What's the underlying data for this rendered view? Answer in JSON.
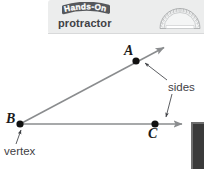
{
  "page": {
    "width": 204,
    "height": 169,
    "background": "#ffffff"
  },
  "header": {
    "banner_background": "#eceded",
    "logo_text": "Hands-On",
    "logo_icon": "hands-on-bubble-logo",
    "title": "protractor",
    "graphic_icon": "protractor-semicircle-icon",
    "text_color": "#3f4145"
  },
  "diagram": {
    "type": "angle-with-labeled-vertex-and-sides",
    "line_color": "#8a8c8e",
    "point_color": "#111111",
    "points": [
      {
        "name": "A",
        "label": "A",
        "x": 136,
        "y": 61
      },
      {
        "name": "B",
        "label": "B",
        "x": 20,
        "y": 124
      },
      {
        "name": "C",
        "label": "C",
        "x": 155,
        "y": 124
      }
    ],
    "rays": [
      {
        "name": "ray-BA",
        "from": "B",
        "through": "A",
        "arrow_tip_x": 166,
        "arrow_tip_y": 46
      },
      {
        "name": "ray-BC",
        "from": "B",
        "through": "C",
        "arrow_tip_x": 184,
        "arrow_tip_y": 124
      }
    ],
    "annotations": [
      {
        "name": "sides",
        "text": "sides",
        "x": 168,
        "y": 82,
        "points_to": [
          "A",
          "C"
        ]
      },
      {
        "name": "vertex",
        "text": "vertex",
        "x": 4,
        "y": 146,
        "points_to": [
          "B"
        ]
      }
    ]
  },
  "side_panel": {
    "name": "cropped-dark-panel",
    "color": "#3a3a3a",
    "border_color": "#6e6e6e"
  }
}
